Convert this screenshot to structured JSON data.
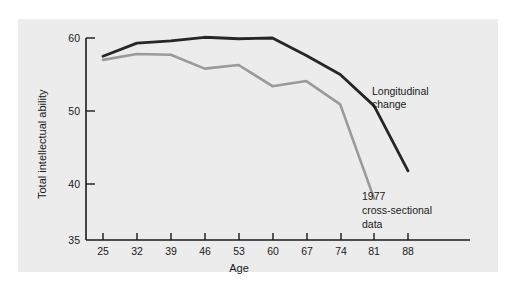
{
  "chart_data": {
    "type": "line",
    "title": "",
    "xlabel": "Age",
    "ylabel": "Total intellectual ability",
    "xlim": [
      25,
      88
    ],
    "ylim": [
      35,
      62
    ],
    "grid": false,
    "legend_position": "inline-annotations",
    "x": [
      25,
      32,
      39,
      46,
      53,
      60,
      67,
      74,
      81,
      88
    ],
    "xticks": [
      "25",
      "32",
      "39",
      "46",
      "53",
      "60",
      "67",
      "74",
      "81",
      "88"
    ],
    "yticks": [
      "35",
      "40",
      "50",
      "60"
    ],
    "ytick_values": [
      35,
      40,
      50,
      60
    ],
    "series": [
      {
        "name": "Longitudinal change",
        "color": "#262626",
        "values": [
          57.5,
          59.3,
          59.6,
          60.1,
          59.9,
          60.0,
          57.6,
          55.0,
          50.7,
          41.8
        ]
      },
      {
        "name": "1977 cross-sectional data",
        "color": "#9a9a9a",
        "values": [
          57.0,
          57.8,
          57.7,
          55.8,
          56.3,
          53.4,
          54.1,
          50.9,
          47.4,
          38.0
        ],
        "x": [
          25,
          32,
          39,
          46,
          53,
          60,
          67,
          74,
          81,
          88
        ],
        "note": "series ends at age 81 on the plot",
        "plotted_values": [
          57.0,
          57.8,
          57.7,
          55.8,
          56.3,
          53.4,
          54.1,
          50.9,
          38.0
        ]
      }
    ],
    "annotations": [
      {
        "id": "longitudinal",
        "lines": [
          "Longitudinal",
          "change"
        ],
        "x_px": 372,
        "y_px": 91
      },
      {
        "id": "cross-sectional",
        "lines": [
          "1977",
          "cross-sectional",
          "data"
        ],
        "x_px": 362,
        "y_px": 196
      }
    ]
  },
  "axes": {
    "ylabel": "Total intellectual ability",
    "xlabel": "Age"
  },
  "yticks": [
    {
      "label": "60",
      "value": 60
    },
    {
      "label": "50",
      "value": 50
    },
    {
      "label": "40",
      "value": 40
    },
    {
      "label": "35",
      "value": 35
    }
  ],
  "xticks": [
    {
      "label": "25",
      "value": 25
    },
    {
      "label": "32",
      "value": 32
    },
    {
      "label": "39",
      "value": 39
    },
    {
      "label": "46",
      "value": 46
    },
    {
      "label": "53",
      "value": 53
    },
    {
      "label": "60",
      "value": 60
    },
    {
      "label": "67",
      "value": 67
    },
    {
      "label": "74",
      "value": 74
    },
    {
      "label": "81",
      "value": 81
    },
    {
      "label": "88",
      "value": 88
    }
  ],
  "annotations": {
    "longitudinal": {
      "line1": "Longitudinal",
      "line2": "change"
    },
    "cross_sectional": {
      "line1": "1977",
      "line2": "cross-sectional",
      "line3": "data"
    }
  },
  "colors": {
    "panel_background": "#ececec",
    "page_background": "#ffffff",
    "axis": "#1a1a1a",
    "longitudinal_line": "#262626",
    "cross_sectional_line": "#9a9a9a",
    "text": "#1a1a1a"
  }
}
